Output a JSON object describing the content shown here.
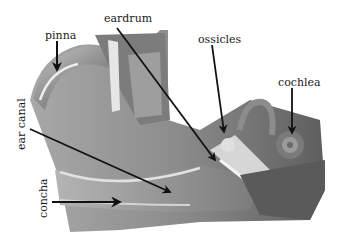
{
  "diagram": {
    "style": "grayscale illustration with black arrows and serif labels",
    "labels": [
      {
        "id": "pinna",
        "text": "pinna",
        "x": 45,
        "y": 30,
        "orientation": "horizontal"
      },
      {
        "id": "eardrum",
        "text": "eardrum",
        "x": 104,
        "y": 13,
        "orientation": "horizontal"
      },
      {
        "id": "ossicles",
        "text": "ossicles",
        "x": 198,
        "y": 34,
        "orientation": "horizontal"
      },
      {
        "id": "cochlea",
        "text": "cochlea",
        "x": 278,
        "y": 77,
        "orientation": "horizontal"
      },
      {
        "id": "ear-canal",
        "text": "ear canal",
        "x": 18,
        "y": 153,
        "orientation": "vertical"
      },
      {
        "id": "concha",
        "text": "concha",
        "x": 32,
        "y": 218,
        "orientation": "vertical"
      }
    ],
    "colors": {
      "background": "#ffffff",
      "arrow": "#111111",
      "text": "#1a1a1a",
      "tissue_light": "#d8d8d8",
      "tissue_mid": "#9a9a9a",
      "tissue_dark": "#5a5a5a"
    }
  }
}
